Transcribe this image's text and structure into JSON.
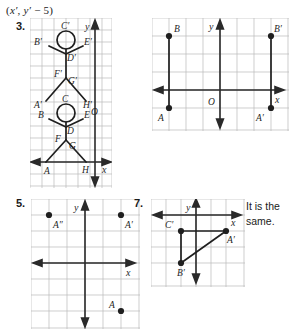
{
  "page": {
    "width": 296,
    "height": 330,
    "background": "#ffffff",
    "ink": "#1f1f1f",
    "grid_color": "#b9b9b9"
  },
  "formula": {
    "full_text": "(x′, y′ − 5)",
    "open_paren": "(",
    "x_prime": "x′",
    "comma": ", ",
    "y_prime": "y′",
    "operator": " − 5",
    "close_paren": ")"
  },
  "problems": [
    {
      "number": "3.",
      "id": "problem-3",
      "type": "stick-figure-translation",
      "grid": {
        "cols": 7,
        "rows": 13,
        "cell": 17.6
      },
      "axes": {
        "x_label": "x",
        "y_label": "y",
        "origin_label": ""
      },
      "labels": [
        "C′",
        "B′",
        "E′",
        "D′",
        "F′",
        "G′",
        "A′",
        "H′",
        "C",
        "B",
        "E",
        "D",
        "F",
        "G",
        "A",
        "H",
        "O"
      ]
    },
    {
      "number": "",
      "id": "problem-4",
      "type": "segment-reflection",
      "grid": {
        "cols": 8,
        "rows": 6,
        "cell": 21.5
      },
      "axes": {
        "x_label": "x",
        "y_label": "y",
        "origin_label": "O"
      },
      "points": [
        {
          "label": "B",
          "x": -4,
          "y": 2
        },
        {
          "label": "A",
          "x": -4,
          "y": -1
        },
        {
          "label": "B′",
          "x": 3,
          "y": 2
        },
        {
          "label": "A′",
          "x": 3,
          "y": -1
        }
      ],
      "segments": [
        {
          "from": "B",
          "to": "A"
        },
        {
          "from": "B′",
          "to": "A′"
        }
      ]
    },
    {
      "number": "5.",
      "id": "problem-5",
      "type": "point-plot",
      "grid": {
        "cols": 6,
        "rows": 8,
        "cell": 19.5
      },
      "axes": {
        "x_label": "x",
        "y_label": "y",
        "origin_label": ""
      },
      "points": [
        {
          "label": "A″",
          "x": -2,
          "y": 3
        },
        {
          "label": "A′",
          "x": 2,
          "y": 3
        },
        {
          "label": "A",
          "x": 2,
          "y": -3
        }
      ]
    },
    {
      "number": "7.",
      "id": "problem-7",
      "type": "triangle-image",
      "grid": {
        "cols": 6,
        "rows": 5,
        "cell": 20
      },
      "axes": {
        "x_label": "x",
        "y_label": "y",
        "origin_label": ""
      },
      "points": [
        {
          "label": "C′",
          "x": -2,
          "y": -1
        },
        {
          "label": "A′",
          "x": 2,
          "y": -1
        },
        {
          "label": "B′",
          "x": -2,
          "y": -3
        }
      ],
      "segments": [
        {
          "from": "C′",
          "to": "A′"
        },
        {
          "from": "C′",
          "to": "B′"
        },
        {
          "from": "B′",
          "to": "A′"
        }
      ]
    }
  ],
  "side_note": {
    "line1": "It is the",
    "line2": "same.",
    "text": "It is the same."
  }
}
